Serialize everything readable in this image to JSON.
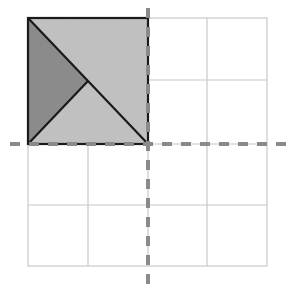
{
  "diagram": {
    "colors": {
      "grid": "#c8c8c8",
      "axis": "#8a8a8a",
      "light_fill": "#c4c4c4",
      "dark_fill": "#8e8e8e",
      "outline": "#1a1a1a",
      "background": "#ffffff"
    },
    "grid": {
      "rows": 4,
      "cols": 4
    },
    "shapes": [
      {
        "name": "upper-right-triangle",
        "fill": "light"
      },
      {
        "name": "left-triangle",
        "fill": "dark"
      },
      {
        "name": "bottom-triangle",
        "fill": "light"
      }
    ],
    "axes": [
      "vertical-dashed-axis",
      "horizontal-dashed-axis"
    ]
  }
}
